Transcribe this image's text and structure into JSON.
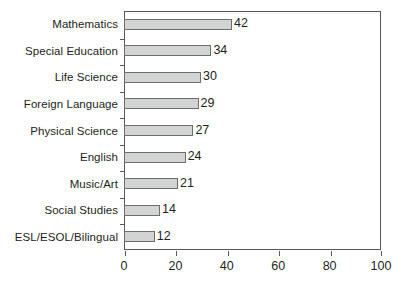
{
  "chart_data": {
    "type": "bar",
    "orientation": "horizontal",
    "title": "",
    "subtitle": "",
    "xlabel": "",
    "ylabel": "",
    "categories": [
      "Mathematics",
      "Special Education",
      "Life Science",
      "Foreign Language",
      "Physical Science",
      "English",
      "Music/Art",
      "Social Studies",
      "ESL/ESOL/Bilingual"
    ],
    "values": [
      42,
      34,
      30,
      29,
      27,
      24,
      21,
      14,
      12
    ],
    "data_labels": [
      "42",
      "34",
      "30",
      "29",
      "27",
      "24",
      "21",
      "14",
      "12"
    ],
    "xlim": [
      0,
      100
    ],
    "x_ticks": [
      0,
      20,
      40,
      60,
      80,
      100
    ],
    "x_tick_labels": [
      "0",
      "20",
      "40",
      "60",
      "80",
      "100"
    ],
    "grid": false,
    "legend": false,
    "legend_position": "none",
    "bar_fill_color": "#d2d3d3",
    "bar_border_color": "#6d6e70",
    "axis_color": "#58595b",
    "text_color": "#231f20",
    "background_color": "#ffffff"
  }
}
